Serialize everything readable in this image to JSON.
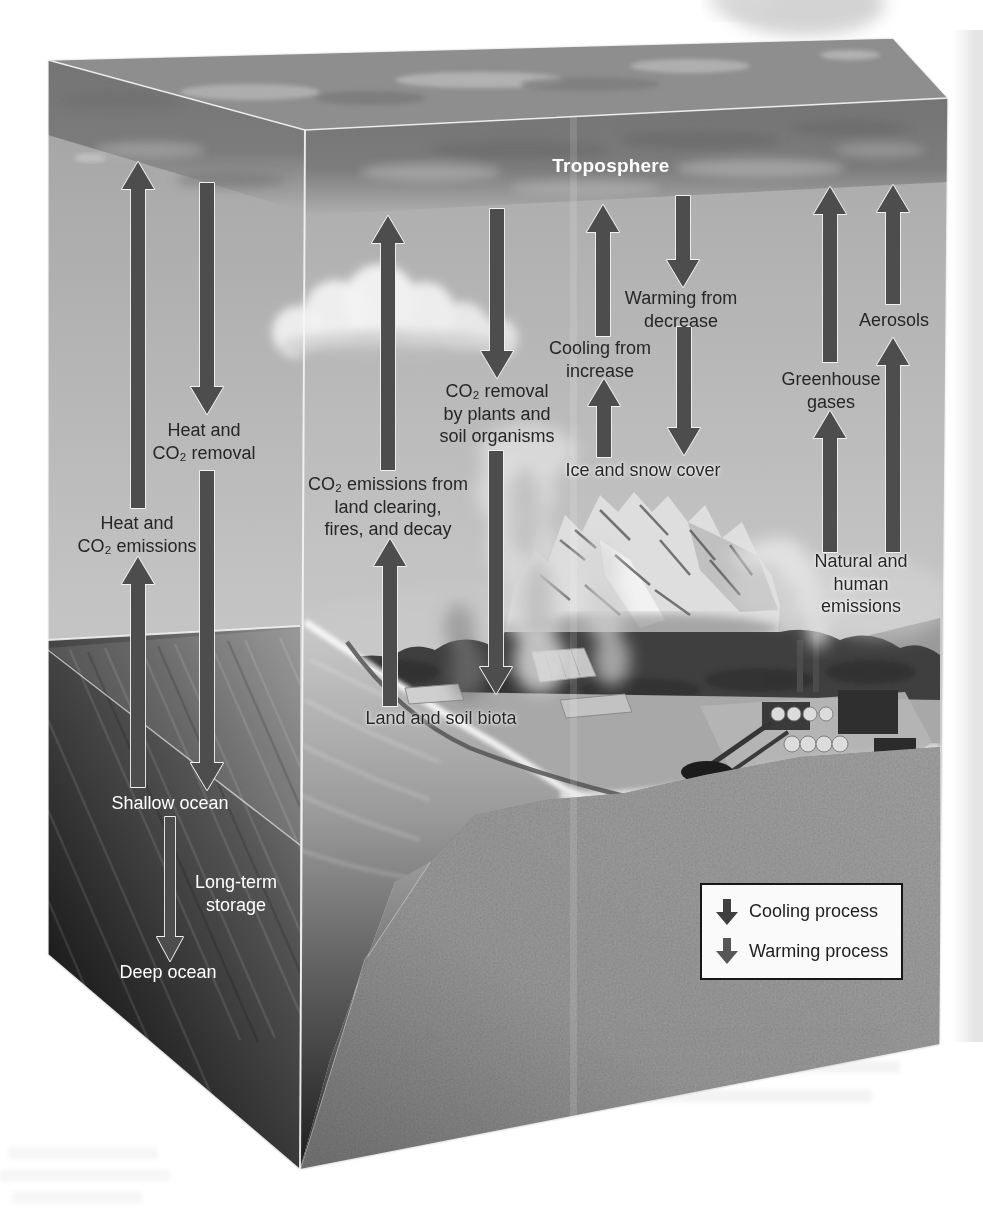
{
  "figure_type": "climate-system-cube-diagram",
  "labels": {
    "troposphere": {
      "lines": [
        "Troposphere"
      ]
    },
    "heat_co2_removal": {
      "lines": [
        "Heat and",
        "CO₂ removal"
      ]
    },
    "heat_co2_emissions": {
      "lines": [
        "Heat and",
        "CO₂ emissions"
      ]
    },
    "land_co2_emissions": {
      "lines": [
        "CO₂ emissions from",
        "land clearing,",
        "fires, and decay"
      ]
    },
    "plants_co2_removal": {
      "lines": [
        "CO₂ removal",
        "by plants and",
        "soil organisms"
      ]
    },
    "cooling_from_increase": {
      "lines": [
        "Cooling from",
        "increase"
      ]
    },
    "warming_from_decrease": {
      "lines": [
        "Warming from",
        "decrease"
      ]
    },
    "ice_and_snow_cover": {
      "lines": [
        "Ice and snow cover"
      ]
    },
    "aerosols": {
      "lines": [
        "Aerosols"
      ]
    },
    "greenhouse_gases": {
      "lines": [
        "Greenhouse",
        "gases"
      ]
    },
    "natural_and_human_emissions": {
      "lines": [
        "Natural and",
        "human emissions"
      ]
    },
    "land_and_soil_biota": {
      "lines": [
        "Land and soil biota"
      ]
    },
    "shallow_ocean": {
      "lines": [
        "Shallow ocean"
      ]
    },
    "long_term_storage": {
      "lines": [
        "Long-term",
        "storage"
      ]
    },
    "deep_ocean": {
      "lines": [
        "Deep ocean"
      ]
    }
  },
  "legend": {
    "items": [
      {
        "icon": "cooling-process-arrow-icon",
        "label": "Cooling process",
        "color": "#3f3f3f"
      },
      {
        "icon": "warming-process-arrow-icon",
        "label": "Warming process",
        "color": "#575757"
      }
    ]
  },
  "colors": {
    "arrow_fill": "#4d4d4d",
    "arrow_outline": "#f2f2f2",
    "label_dark": "#262626",
    "label_light": "#ffffff"
  },
  "flows": [
    {
      "name": "heat-co2-emissions-upper",
      "x": 138,
      "top": 162,
      "bottom": 508,
      "direction": "up"
    },
    {
      "name": "heat-co2-emissions-lower",
      "x": 138,
      "top": 557,
      "bottom": 787,
      "direction": "up"
    },
    {
      "name": "heat-co2-removal-upper",
      "x": 207,
      "top": 183,
      "bottom": 414,
      "direction": "down"
    },
    {
      "name": "heat-co2-removal-lower",
      "x": 207,
      "top": 471,
      "bottom": 790,
      "direction": "down"
    },
    {
      "name": "land-co2-emissions-upper",
      "x": 388,
      "top": 216,
      "bottom": 470,
      "direction": "up"
    },
    {
      "name": "land-co2-emissions-lower",
      "x": 390,
      "top": 539,
      "bottom": 706,
      "direction": "up"
    },
    {
      "name": "plants-co2-removal-upper",
      "x": 497,
      "top": 209,
      "bottom": 378,
      "direction": "down"
    },
    {
      "name": "plants-co2-removal-lower",
      "x": 496,
      "top": 451,
      "bottom": 694,
      "direction": "down"
    },
    {
      "name": "cooling-from-increase-upper",
      "x": 603,
      "top": 205,
      "bottom": 336,
      "direction": "up"
    },
    {
      "name": "cooling-from-increase-lower",
      "x": 604,
      "top": 379,
      "bottom": 457,
      "direction": "up"
    },
    {
      "name": "warming-from-decrease-upper",
      "x": 683,
      "top": 196,
      "bottom": 287,
      "direction": "down"
    },
    {
      "name": "warming-from-decrease-lower",
      "x": 684,
      "top": 327,
      "bottom": 455,
      "direction": "down"
    },
    {
      "name": "greenhouse-gases-upper",
      "x": 830,
      "top": 187,
      "bottom": 362,
      "direction": "up"
    },
    {
      "name": "greenhouse-gases-lower",
      "x": 830,
      "top": 411,
      "bottom": 552,
      "direction": "up"
    },
    {
      "name": "aerosols-upper",
      "x": 893,
      "top": 185,
      "bottom": 304,
      "direction": "up"
    },
    {
      "name": "aerosols-lower",
      "x": 893,
      "top": 338,
      "bottom": 552,
      "direction": "up"
    },
    {
      "name": "long-term-storage",
      "x": 170,
      "top": 817,
      "bottom": 961,
      "direction": "down",
      "shaft_w": 5,
      "head_w": 13,
      "head_l": 24
    }
  ]
}
